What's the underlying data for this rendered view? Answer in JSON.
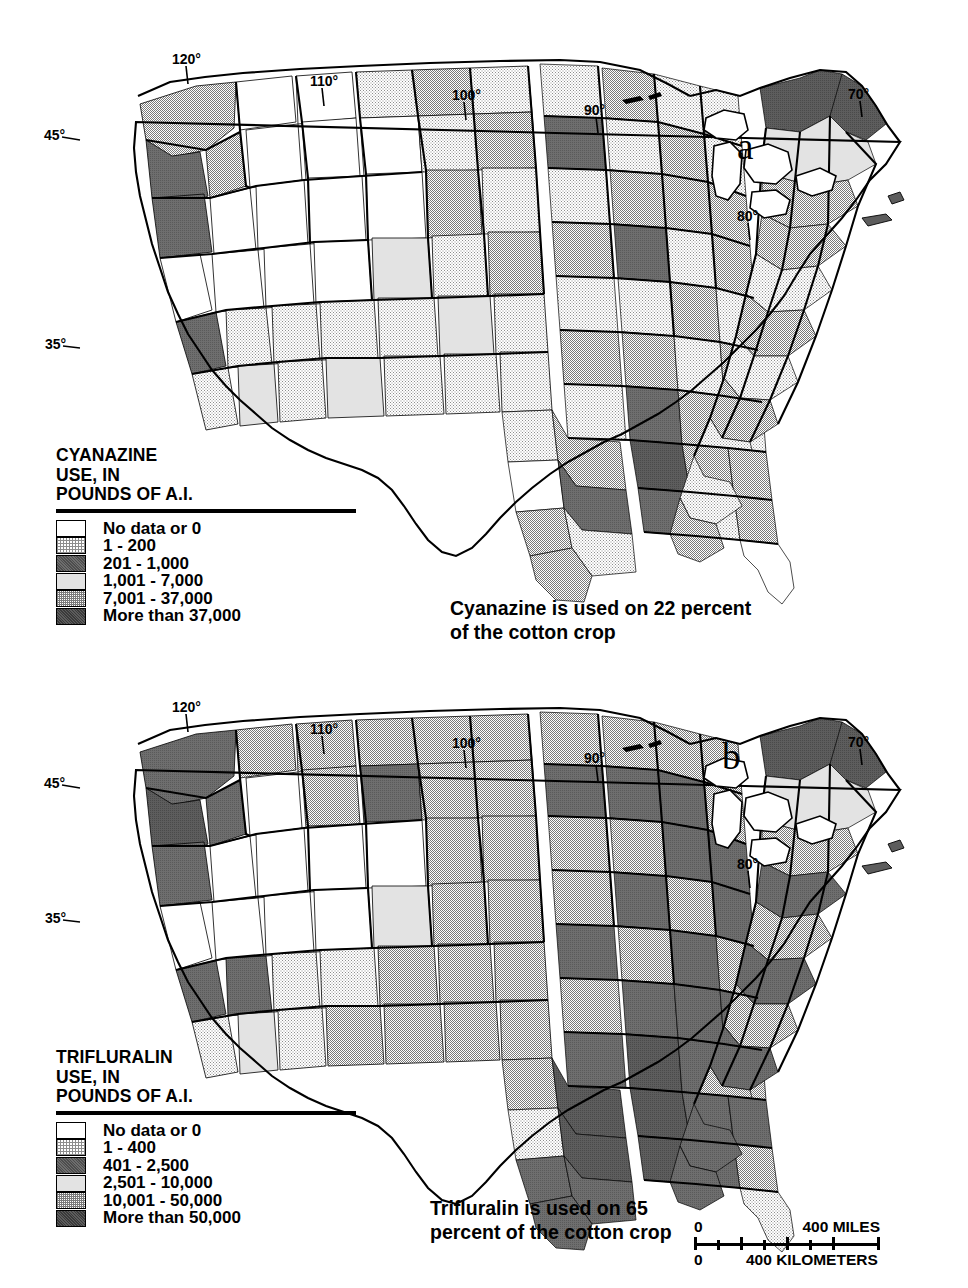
{
  "figure": {
    "type": "two-panel choropleth map",
    "region": "Conterminous United States, by county"
  },
  "panels": [
    {
      "letter": "a",
      "legend": {
        "title_line1": "CYANAZINE",
        "title_line2": "USE, IN",
        "title_line3": "POUNDS OF A.I.",
        "classes": [
          {
            "label": "No data or 0",
            "pattern": "white"
          },
          {
            "label": "1 - 200",
            "pattern": "light-stipple"
          },
          {
            "label": "201 - 1,000",
            "pattern": "dark-gray"
          },
          {
            "label": "1,001 - 7,000",
            "pattern": "very-light-gray"
          },
          {
            "label": "7,001 - 37,000",
            "pattern": "medium-stipple"
          },
          {
            "label": "More than 37,000",
            "pattern": "darkest-gray"
          }
        ]
      },
      "caption": "Cyanazine is used on 22 percent\nof the cotton crop",
      "graticule": {
        "longitudes": [
          "120°",
          "110°",
          "100°",
          "90°",
          "80°",
          "70°"
        ],
        "latitudes": [
          "45°",
          "35°"
        ]
      }
    },
    {
      "letter": "b",
      "legend": {
        "title_line1": "TRIFLURALIN",
        "title_line2": "USE, IN",
        "title_line3": "POUNDS OF A.I.",
        "classes": [
          {
            "label": "No data or 0",
            "pattern": "white"
          },
          {
            "label": "1 - 400",
            "pattern": "light-stipple"
          },
          {
            "label": "401 - 2,500",
            "pattern": "dark-gray"
          },
          {
            "label": "2,501 - 10,000",
            "pattern": "very-light-gray"
          },
          {
            "label": "10,001 - 50,000",
            "pattern": "medium-stipple"
          },
          {
            "label": "More than 50,000",
            "pattern": "darkest-gray"
          }
        ]
      },
      "caption": "Trifluralin is used on 65\npercent of the cotton crop",
      "graticule": {
        "longitudes": [
          "120°",
          "110°",
          "100°",
          "90°",
          "80°",
          "70°"
        ],
        "latitudes": [
          "45°",
          "35°"
        ]
      }
    }
  ],
  "scalebar": {
    "miles_zero": "0",
    "miles_value": "400 MILES",
    "km_zero": "0",
    "km_value": "400 KILOMETERS"
  },
  "colors": {
    "ink": "#000000",
    "paper": "#ffffff",
    "class_dark_gray": "#6e6e6e",
    "class_very_light_gray": "#e3e3e3",
    "class_darkest_gray": "#5d5d5d",
    "stipple_light": "#8d8d8d",
    "stipple_medium": "#7a7a7a"
  }
}
